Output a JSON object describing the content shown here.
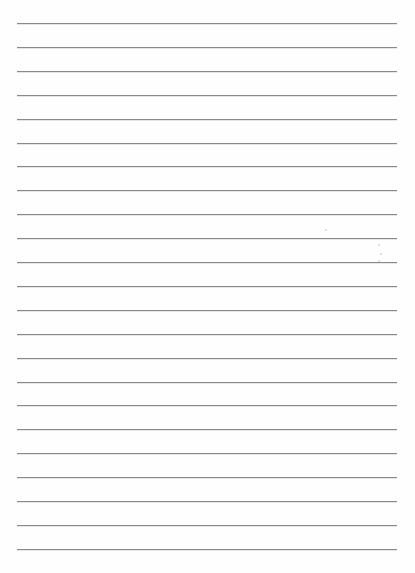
{
  "page": {
    "type": "lined-paper",
    "line_count": 23,
    "first_line_y": 23,
    "line_spacing": 23.9,
    "line_left": 17,
    "line_width": 380,
    "line_color": "#8a8a8a",
    "background_color": "#fefefe"
  }
}
